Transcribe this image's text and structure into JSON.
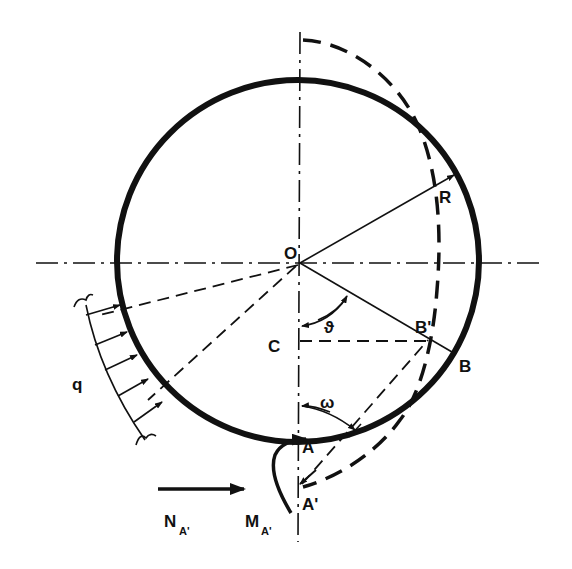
{
  "diagram": {
    "colors": {
      "ink": "#111111",
      "background": "#ffffff"
    },
    "labels": {
      "O": "O",
      "R": "R",
      "C": "C",
      "A": "A",
      "A_prime": "A'",
      "B": "B",
      "B_prime": "B'",
      "q": "q",
      "theta": "ϑ",
      "omega": "ω",
      "N": "N",
      "N_sub": "A'",
      "M": "M",
      "M_sub": "A'"
    },
    "elements": [
      "solid-circle-ring",
      "dashed-deformed-curve",
      "horizontal-centerline",
      "vertical-centerline",
      "radius-R-arrow",
      "radial-line-OB",
      "dashed-line-CB-prime",
      "distributed-load-q",
      "force-arrow-N",
      "moment-arrow-M"
    ]
  }
}
